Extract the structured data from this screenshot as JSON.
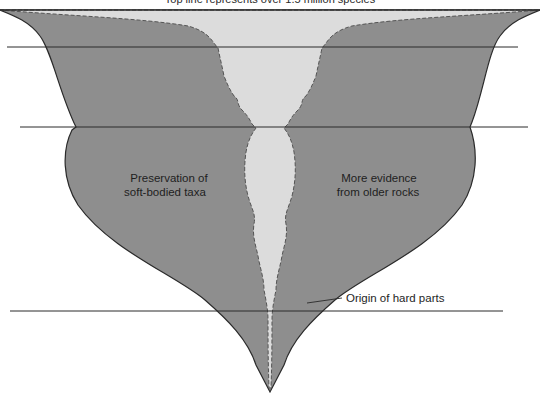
{
  "diagram": {
    "title": "Top line represents over 1.5 million species",
    "labels": {
      "left_region": [
        "Preservation of",
        "soft-bodied taxa"
      ],
      "right_region": [
        "More evidence",
        "from older rocks"
      ],
      "callout": "Origin of hard parts"
    },
    "regions": [
      {
        "name": "outer-shape",
        "meaning": "total diversity",
        "color": "#8e8e8e"
      },
      {
        "name": "inner-shape",
        "meaning": "known/recorded diversity",
        "color": "#dcdcdc"
      }
    ],
    "colors": {
      "background": "#ffffff",
      "outer_fill": "#8e8e8e",
      "inner_fill": "#dcdcdc",
      "line": "#2a2a2a"
    }
  }
}
